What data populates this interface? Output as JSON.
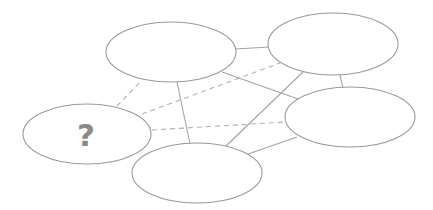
{
  "diagram": {
    "type": "network-graph",
    "colors": {
      "node_stroke": "#9a9a9a",
      "edge": "#a3a3a3",
      "label": "#8a8a8a",
      "background": "#ffffff"
    },
    "nodes": [
      {
        "id": "top-left",
        "label": "",
        "cx": 171,
        "cy": 52,
        "rx": 65,
        "ry": 30
      },
      {
        "id": "top-right",
        "label": "",
        "cx": 333,
        "cy": 44,
        "rx": 65,
        "ry": 31
      },
      {
        "id": "right",
        "label": "",
        "cx": 350,
        "cy": 117,
        "rx": 65,
        "ry": 30
      },
      {
        "id": "bottom",
        "label": "",
        "cx": 197,
        "cy": 173,
        "rx": 65,
        "ry": 30
      },
      {
        "id": "unknown",
        "label": "?",
        "cx": 87,
        "cy": 134,
        "rx": 64,
        "ry": 30
      }
    ],
    "edges": [
      {
        "from": "top-left",
        "to": "top-right",
        "style": "solid"
      },
      {
        "from": "top-left",
        "to": "right",
        "style": "solid"
      },
      {
        "from": "top-left",
        "to": "bottom",
        "style": "solid"
      },
      {
        "from": "top-right",
        "to": "right",
        "style": "solid"
      },
      {
        "from": "top-right",
        "to": "bottom",
        "style": "solid"
      },
      {
        "from": "right",
        "to": "bottom",
        "style": "solid"
      },
      {
        "from": "unknown",
        "to": "top-left",
        "style": "dashed"
      },
      {
        "from": "unknown",
        "to": "top-right",
        "style": "dashed"
      },
      {
        "from": "unknown",
        "to": "right",
        "style": "dashed"
      }
    ],
    "unknown_label": "?"
  }
}
